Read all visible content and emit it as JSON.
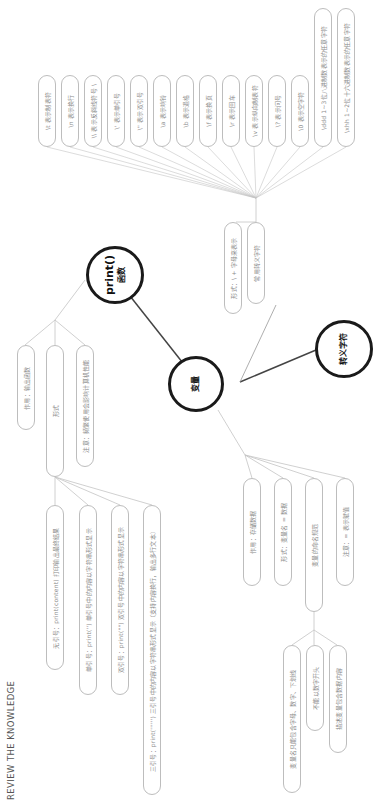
{
  "page": {
    "footer_label": "REVIEW THE KNOWLEDGE"
  },
  "hubs": {
    "print": {
      "line1": "print()",
      "line2": "函数"
    },
    "variable": {
      "label": "变量"
    },
    "escape": {
      "label": "转义字符"
    }
  },
  "print_branch": {
    "children": [
      {
        "label": "作用：输出函数"
      },
      {
        "label": "形式"
      },
      {
        "label": "注意：频繁使用会影响计算机性能"
      }
    ],
    "form_children": [
      {
        "label": "无引号：print(content) 打印输出最终结果"
      },
      {
        "label": "单引号：print('') 单引号中的内容以字符串形式显示"
      },
      {
        "label": "双引号：print(\"\") 双引号中的内容以字符串形式显示"
      },
      {
        "label": "三引号：print('''''') 三引号中的内容以字符串形式显示（支持内容换行，输出多行文本）"
      }
    ]
  },
  "variable_branch": {
    "children": [
      {
        "label": "作用：存储数据"
      },
      {
        "label": "形式：变量名 = 数据"
      },
      {
        "label": "变量的命名规范"
      },
      {
        "label": "注意：= 表示赋值"
      }
    ],
    "naming_children": [
      {
        "label": "变量名只能包含字母、数字、下划线"
      },
      {
        "label": "不能以数字开头"
      },
      {
        "label": "描述变量包含数据内容"
      }
    ]
  },
  "escape_branch": {
    "children": [
      {
        "label": "形式：\\ + 字母来表示"
      },
      {
        "label": "常用转义字符"
      }
    ],
    "common": [
      {
        "label": "\\t 表示制表符"
      },
      {
        "label": "\\n 表示换行"
      },
      {
        "label": "\\\\ 表示反斜线符号 \\"
      },
      {
        "label": "\\' 表示单引号"
      },
      {
        "label": "\\\" 表示双引号"
      },
      {
        "label": "\\a 表示响铃"
      },
      {
        "label": "\\b 表示退格"
      },
      {
        "label": "\\f 表示换页"
      },
      {
        "label": "\\r 表示回车"
      },
      {
        "label": "\\v 表示纵向制表符"
      },
      {
        "label": "\\? 表示问号"
      },
      {
        "label": "\\0 表示空字符"
      },
      {
        "label": "\\ddd 1~3位八进制数表示的任意字符"
      },
      {
        "label": "\\xhh 1~2位十六进制数表示的任意字符"
      }
    ]
  },
  "colors": {
    "hub_border": "#1a1a1a",
    "pill_border": "#bdbdbd",
    "line": "#c4c4c4",
    "text": "#8a8a8a"
  }
}
